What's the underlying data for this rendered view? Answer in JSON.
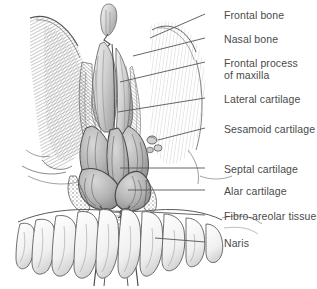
{
  "figure": {
    "background_color": "#ffffff",
    "ink_color": "#4a4a4a",
    "line_color": "#555555",
    "width": 317,
    "height": 289
  },
  "labels": [
    {
      "id": "frontal-bone",
      "text": "Frontal bone",
      "text2": "",
      "x": 224,
      "y": 9,
      "leader": {
        "x1": 205,
        "y1": 14,
        "x2": 150,
        "y2": 38
      }
    },
    {
      "id": "nasal-bone",
      "text": "Nasal bone",
      "text2": "",
      "x": 224,
      "y": 33,
      "leader": {
        "x1": 205,
        "y1": 38,
        "x2": 133,
        "y2": 56
      }
    },
    {
      "id": "frontal-process-maxilla",
      "text": "Frontal process",
      "text2": "of maxilla",
      "x": 224,
      "y": 57,
      "leader": {
        "x1": 205,
        "y1": 62,
        "x2": 120,
        "y2": 82
      }
    },
    {
      "id": "lateral-cartilage",
      "text": "Lateral cartilage",
      "text2": "",
      "x": 224,
      "y": 93,
      "leader": {
        "x1": 205,
        "y1": 98,
        "x2": 118,
        "y2": 112
      }
    },
    {
      "id": "sesamoid-cartilage",
      "text": "Sesamoid cartilage",
      "text2": "",
      "x": 224,
      "y": 123,
      "leader": {
        "x1": 205,
        "y1": 128,
        "x2": 158,
        "y2": 140
      }
    },
    {
      "id": "septal-cartilage",
      "text": "Septal cartilage",
      "text2": "",
      "x": 224,
      "y": 163,
      "leader": {
        "x1": 205,
        "y1": 168,
        "x2": 120,
        "y2": 168
      }
    },
    {
      "id": "alar-cartilage",
      "text": "Alar cartilage",
      "text2": "",
      "x": 224,
      "y": 185,
      "leader": {
        "x1": 205,
        "y1": 190,
        "x2": 128,
        "y2": 190
      }
    },
    {
      "id": "fibro-areolar-tissue",
      "text": "Fibro-areolar tissue",
      "text2": "",
      "x": 224,
      "y": 210,
      "leader": {
        "x1": 205,
        "y1": 215,
        "x2": 150,
        "y2": 212
      }
    },
    {
      "id": "naris",
      "text": "Naris",
      "text2": "",
      "x": 224,
      "y": 237,
      "leader": {
        "x1": 205,
        "y1": 242,
        "x2": 155,
        "y2": 238
      }
    }
  ],
  "artwork": {
    "description": "Shaded line engraving of the anterior nasal skeleton viewed from the front: frontal bone and orbital margins above, paired nasal bones and frontal processes of the maxilla in the midline, lateral nasal cartilages, sesamoid cartilages, the septal cartilage in the midline, the paired alar cartilages forming the nostrils, fibro-areolar tissue at the nostril margins, the nares, and the upper row of maxillary teeth below.",
    "parts": [
      "frontal bone",
      "nasal bone",
      "frontal process of maxilla",
      "lateral cartilage",
      "sesamoid cartilage",
      "septal cartilage",
      "alar cartilage",
      "fibro-areolar tissue",
      "naris",
      "maxillary teeth"
    ]
  }
}
